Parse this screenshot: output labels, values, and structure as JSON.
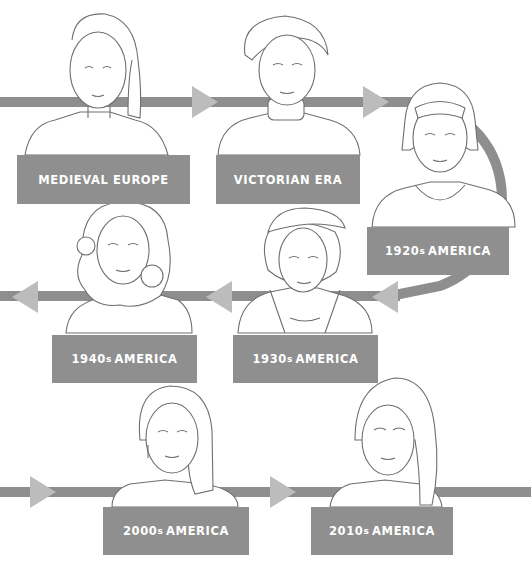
{
  "diagram": {
    "type": "timeline-flow",
    "colors": {
      "path": "#8e8e8e",
      "arrowhead": "#bcbcbc",
      "label_bg": "#8f8f8f",
      "label_text": "#ffffff",
      "line_art": "#6f6f6f"
    },
    "eras": [
      {
        "id": "medieval",
        "label": "MEDIEVAL EUROPE",
        "num": "",
        "suffix": "",
        "region": ""
      },
      {
        "id": "victorian",
        "label": "VICTORIAN ERA",
        "num": "",
        "suffix": "",
        "region": ""
      },
      {
        "id": "1920s",
        "label": "",
        "num": "1920",
        "suffix": "s",
        "region": "AMERICA"
      },
      {
        "id": "1930s",
        "label": "",
        "num": "1930",
        "suffix": "s",
        "region": "AMERICA"
      },
      {
        "id": "1940s",
        "label": "",
        "num": "1940",
        "suffix": "s",
        "region": "AMERICA"
      },
      {
        "id": "2000s",
        "label": "",
        "num": "2000",
        "suffix": "s",
        "region": "AMERICA"
      },
      {
        "id": "2010s",
        "label": "",
        "num": "2010",
        "suffix": "s",
        "region": "AMERICA"
      }
    ],
    "flow": [
      "MEDIEVAL EUROPE",
      "VICTORIAN ERA",
      "1920s AMERICA",
      "1930s AMERICA",
      "1940s AMERICA",
      "2000s AMERICA",
      "2010s AMERICA"
    ]
  }
}
